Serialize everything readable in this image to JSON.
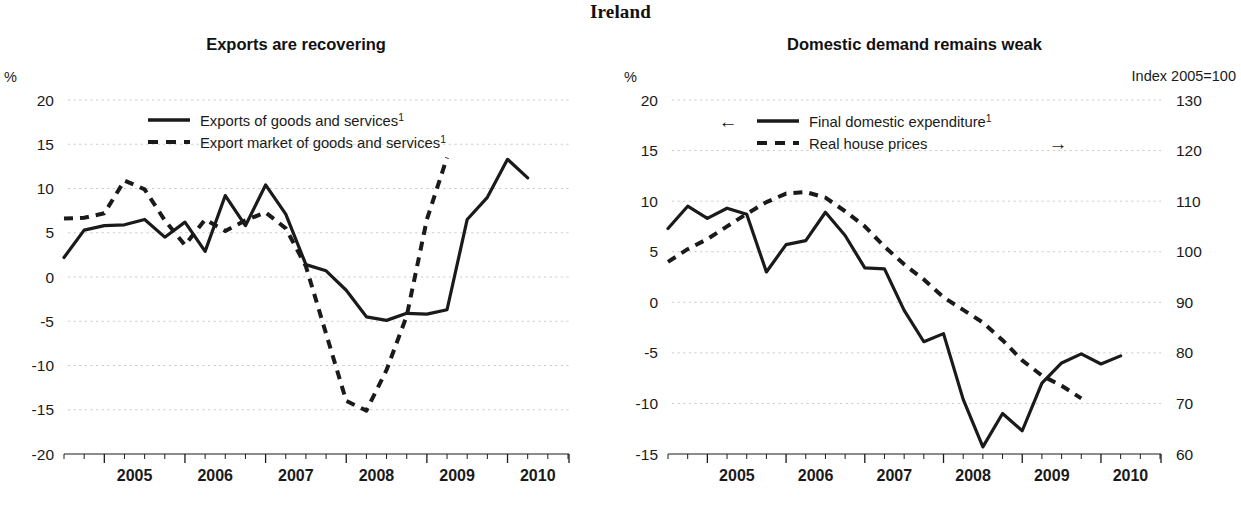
{
  "figure": {
    "main_title": "Ireland",
    "background_color": "#ffffff",
    "line_color": "#1a1a1a",
    "grid_color": "#cccccc"
  },
  "panels": [
    {
      "id": "exports",
      "title": "Exports are recovering",
      "left_axis_unit": "%",
      "right_axis_unit": "",
      "legend": [
        {
          "label": "Exports of goods and services",
          "superscript": "1",
          "style": "solid",
          "arrow": ""
        },
        {
          "label": "Export market of goods and services",
          "superscript": "1",
          "style": "dashed",
          "arrow": ""
        }
      ]
    },
    {
      "id": "domestic-demand",
      "title": "Domestic demand remains weak",
      "left_axis_unit": "%",
      "right_axis_unit": "Index 2005=100",
      "legend": [
        {
          "label": "Final domestic expenditure",
          "superscript": "1",
          "style": "solid",
          "arrow": "←"
        },
        {
          "label": "Real house prices",
          "superscript": "",
          "style": "dashed",
          "arrow": "→"
        }
      ]
    }
  ],
  "chart_data": [
    {
      "type": "line",
      "title": "Exports are recovering",
      "xlabel": "",
      "ylabel": "%",
      "ylim": [
        -20,
        20
      ],
      "yticks": [
        20,
        15,
        10,
        5,
        0,
        -5,
        -10,
        -15,
        -20
      ],
      "grid": true,
      "legend_position": "top-center",
      "xlim": [
        "2004Q3",
        "2010Q4"
      ],
      "xticks": [
        "2005",
        "2006",
        "2007",
        "2008",
        "2009",
        "2010"
      ],
      "x": [
        "2004Q3",
        "2004Q4",
        "2005Q1",
        "2005Q2",
        "2005Q3",
        "2005Q4",
        "2006Q1",
        "2006Q2",
        "2006Q3",
        "2006Q4",
        "2007Q1",
        "2007Q2",
        "2007Q3",
        "2007Q4",
        "2008Q1",
        "2008Q2",
        "2008Q3",
        "2008Q4",
        "2009Q1",
        "2009Q2",
        "2009Q3",
        "2009Q4",
        "2010Q1",
        "2010Q2",
        "2010Q3"
      ],
      "series": [
        {
          "name": "Exports of goods and services",
          "style": "solid",
          "axis": "left",
          "values": [
            2.2,
            5.3,
            5.8,
            5.9,
            6.5,
            4.5,
            6.2,
            2.9,
            9.2,
            5.8,
            10.4,
            7.1,
            1.4,
            0.7,
            -1.5,
            -4.5,
            -4.9,
            -4.1,
            -4.2,
            -3.7,
            6.5,
            9.0,
            13.3,
            11.2,
            null
          ]
        },
        {
          "name": "Export market of goods and services",
          "style": "dashed",
          "axis": "left",
          "values": [
            6.6,
            6.7,
            7.2,
            10.9,
            9.9,
            6.4,
            3.6,
            6.5,
            5.2,
            6.4,
            7.3,
            5.5,
            1.2,
            -6.4,
            -14.0,
            -15.1,
            -10.5,
            -4.4,
            6.5,
            13.5,
            null,
            null,
            null,
            null,
            null
          ]
        }
      ]
    },
    {
      "type": "line",
      "title": "Domestic demand remains weak",
      "xlabel": "",
      "ylabel": "%",
      "y2label": "Index 2005=100",
      "ylim": [
        -15,
        20
      ],
      "yticks": [
        20,
        15,
        10,
        5,
        0,
        -5,
        -10,
        -15
      ],
      "y2lim": [
        60,
        130
      ],
      "y2ticks": [
        130,
        120,
        110,
        100,
        90,
        80,
        70,
        60
      ],
      "grid": true,
      "legend_position": "top-center",
      "xlim": [
        "2004Q3",
        "2010Q4"
      ],
      "xticks": [
        "2005",
        "2006",
        "2007",
        "2008",
        "2009",
        "2010"
      ],
      "x": [
        "2004Q3",
        "2004Q4",
        "2005Q1",
        "2005Q2",
        "2005Q3",
        "2005Q4",
        "2006Q1",
        "2006Q2",
        "2006Q3",
        "2006Q4",
        "2007Q1",
        "2007Q2",
        "2007Q3",
        "2007Q4",
        "2008Q1",
        "2008Q2",
        "2008Q3",
        "2008Q4",
        "2009Q1",
        "2009Q2",
        "2009Q3",
        "2009Q4",
        "2010Q1",
        "2010Q2",
        "2010Q3"
      ],
      "series": [
        {
          "name": "Final domestic expenditure",
          "style": "solid",
          "axis": "left",
          "values": [
            7.3,
            9.5,
            8.3,
            9.3,
            8.7,
            3.0,
            5.7,
            6.1,
            8.9,
            6.6,
            3.4,
            3.3,
            -0.8,
            -3.9,
            -3.1,
            -9.6,
            -14.3,
            -11.0,
            -12.7,
            -8.0,
            -6.0,
            -5.1,
            -6.1,
            -5.3,
            null
          ]
        },
        {
          "name": "Real house prices",
          "style": "dashed",
          "axis": "right",
          "values": [
            98.0,
            100.5,
            102.5,
            105.0,
            107.5,
            109.8,
            111.5,
            111.8,
            110.7,
            108.0,
            105.0,
            101.0,
            97.5,
            94.5,
            91.0,
            88.5,
            86.0,
            82.5,
            78.5,
            75.5,
            73.5,
            71.0,
            null,
            null,
            null
          ]
        }
      ]
    }
  ]
}
